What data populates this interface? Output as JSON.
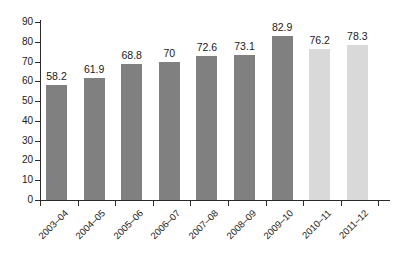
{
  "chart_data": {
    "type": "bar",
    "title": "",
    "subtitle": "",
    "xlabel": "",
    "ylabel": "",
    "ylim": [
      0,
      90
    ],
    "ytick_interval": 10,
    "yticks": [
      0,
      10,
      20,
      30,
      40,
      50,
      60,
      70,
      80,
      90
    ],
    "grid": false,
    "legend": false,
    "legend_position": "none",
    "categories": [
      "2003–04",
      "2004–05",
      "2005–06",
      "2006–07",
      "2007–08",
      "2008–09",
      "2009–10",
      "2010–11",
      "2011–12"
    ],
    "values": [
      58.2,
      61.9,
      68.8,
      70,
      72.6,
      73.1,
      82.9,
      76.2,
      78.3
    ],
    "value_labels": [
      "58.2",
      "61.9",
      "68.8",
      "70",
      "72.6",
      "73.1",
      "82.9",
      "76.2",
      "78.3"
    ],
    "bar_colors": [
      "#808080",
      "#808080",
      "#808080",
      "#808080",
      "#808080",
      "#808080",
      "#808080",
      "#d9d9d9",
      "#d9d9d9"
    ],
    "series": [
      {
        "name": "",
        "values": [
          58.2,
          61.9,
          68.8,
          70,
          72.6,
          73.1,
          82.9,
          76.2,
          78.3
        ]
      }
    ]
  },
  "style": {
    "background": "#ffffff",
    "axis_color": "#2b2b2b",
    "text_color": "#1a1a1a",
    "bar_color_primary": "#808080",
    "bar_color_secondary": "#d9d9d9"
  }
}
